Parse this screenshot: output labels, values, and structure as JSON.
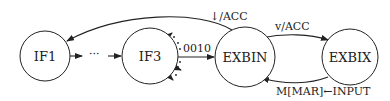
{
  "diagram": {
    "type": "state-machine",
    "nodes": [
      {
        "id": "IF1",
        "label": "IF1"
      },
      {
        "id": "IF3",
        "label": "IF3"
      },
      {
        "id": "EXBIN",
        "label": "EXBIN"
      },
      {
        "id": "EXBIX",
        "label": "EXBIX"
      }
    ],
    "ellipsis": "···",
    "edges": [
      {
        "from": "IF1",
        "to": "IF3",
        "label": "",
        "via": "···"
      },
      {
        "from": "IF3",
        "to": "EXBIN",
        "label": "0010"
      },
      {
        "from": "EXBIN",
        "to": "IF1",
        "label": "↓/ACC"
      },
      {
        "from": "EXBIN",
        "to": "EXBIX",
        "label": "v/ACC"
      },
      {
        "from": "EXBIX",
        "to": "EXBIN",
        "label": "M[MAR]←INPUT"
      }
    ]
  }
}
